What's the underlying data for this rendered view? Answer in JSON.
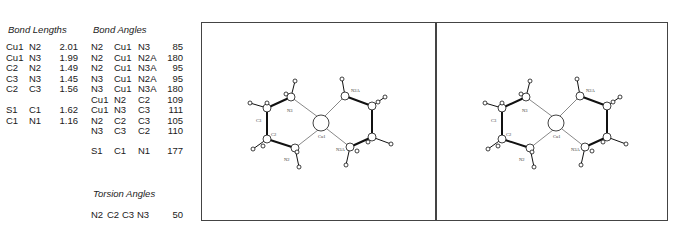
{
  "bond_lengths": {
    "title": "Bond Lengths",
    "rows": [
      {
        "a1": "Cu1",
        "a2": "N2",
        "value": "2.01"
      },
      {
        "a1": "Cu1",
        "a2": "N3",
        "value": "1.99"
      },
      {
        "a1": "C2",
        "a2": "N2",
        "value": "1.49"
      },
      {
        "a1": "C3",
        "a2": "N3",
        "value": "1.45"
      },
      {
        "a1": "C2",
        "a2": "C3",
        "value": "1.56"
      },
      {
        "a1": "S1",
        "a2": "C1",
        "value": "1.62"
      },
      {
        "a1": "C1",
        "a2": "N1",
        "value": "1.16"
      }
    ]
  },
  "bond_angles": {
    "title": "Bond Angles",
    "rows": [
      {
        "a1": "N2",
        "a2": "Cu1",
        "a3": "N3",
        "value": "85"
      },
      {
        "a1": "N2",
        "a2": "Cu1",
        "a3": "N2A",
        "value": "180"
      },
      {
        "a1": "N2",
        "a2": "Cu1",
        "a3": "N3A",
        "value": "95"
      },
      {
        "a1": "N3",
        "a2": "Cu1",
        "a3": "N2A",
        "value": "95"
      },
      {
        "a1": "N3",
        "a2": "Cu1",
        "a3": "N3A",
        "value": "180"
      },
      {
        "a1": "Cu1",
        "a2": "N2",
        "a3": "C2",
        "value": "109"
      },
      {
        "a1": "Cu1",
        "a2": "N3",
        "a3": "C3",
        "value": "111"
      },
      {
        "a1": "N2",
        "a2": "C2",
        "a3": "C3",
        "value": "105"
      },
      {
        "a1": "N3",
        "a2": "C3",
        "a3": "C2",
        "value": "110"
      },
      {
        "a1": "S1",
        "a2": "C1",
        "a3": "N1",
        "value": "177"
      }
    ]
  },
  "torsion_angles": {
    "title": "Torsion Angles",
    "rows": [
      {
        "a1": "N2",
        "a2": "C2",
        "a3": "C3",
        "a4": "N3",
        "value": "50"
      }
    ]
  },
  "stereo_view": {
    "labels": {
      "cu": "Cu1",
      "n3": "N3",
      "c3": "C3",
      "c2": "C2",
      "n2": "N2",
      "n2a": "N2A",
      "n3a": "N3A"
    }
  }
}
